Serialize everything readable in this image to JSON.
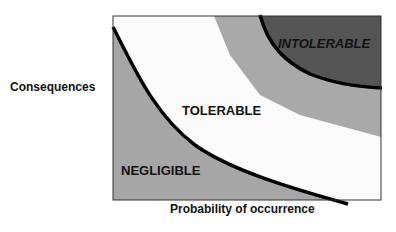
{
  "diagram": {
    "title": "",
    "axes": {
      "y_label": "Consequences",
      "x_label": "Probability of occurrence"
    },
    "regions": [
      {
        "id": "negligible",
        "label": "NEGLIGIBLE",
        "color": "#a6a6a6"
      },
      {
        "id": "tolerable",
        "label": "TOLERABLE",
        "color": "#fbfbfb"
      },
      {
        "id": "alarp-band",
        "label": "",
        "color": "#a9a9a9"
      },
      {
        "id": "intolerable",
        "label": "INTOLERABLE",
        "color": "#555555"
      }
    ],
    "boundary_color": "#000000",
    "frame_color": "#333333"
  }
}
